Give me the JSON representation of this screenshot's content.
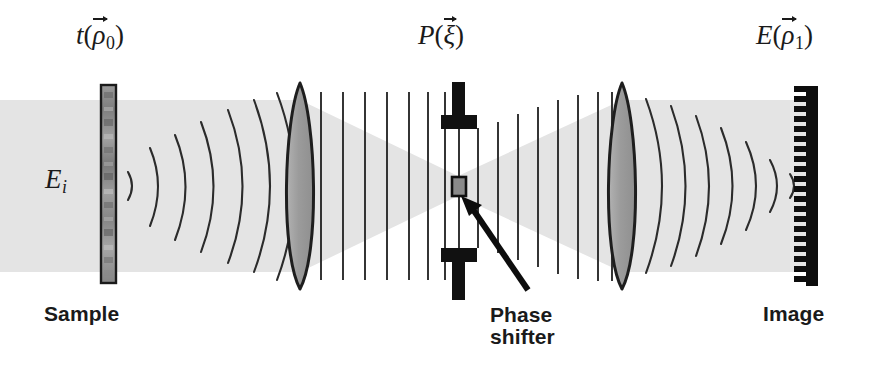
{
  "figure": {
    "title_alt": "Optical phase contrast imaging system schematic",
    "background_color": "#ffffff",
    "width": 869,
    "height": 371
  },
  "colors": {
    "beam_fill": "#e4e4e4",
    "beam_fill_dark": "#dcdcdc",
    "lens_fill": "#9d9d9d",
    "lens_stroke": "#1e1e1e",
    "wave_stroke": "#2a2a2a",
    "sample_fill": "#8e8e8e",
    "sample_stroke": "#1a1a1a",
    "stop_fill": "#111111",
    "shifter_fill": "#8a8a8a",
    "detector_fill": "#0d0d0d",
    "text_color": "#1a1a1a"
  },
  "labels": {
    "sample_field": {
      "symbol": "t",
      "arg": "ρ",
      "subscript": "0",
      "vector": true,
      "text": "t(ρ⃗0)"
    },
    "pupil_plane": {
      "symbol": "P",
      "arg": "ξ",
      "subscript": "",
      "vector": true,
      "text": "P(ξ⃗)"
    },
    "image_field": {
      "symbol": "E",
      "arg": "ρ",
      "subscript": "1",
      "vector": true,
      "text": "E(ρ⃗1)"
    },
    "incident_field": {
      "symbol": "E",
      "subscript": "i",
      "text": "Eᵢ"
    },
    "sample_caption": "Sample",
    "phase_shifter_caption_line1": "Phase",
    "phase_shifter_caption_line2": "shifter",
    "image_caption": "Image"
  },
  "components": [
    {
      "name": "sample",
      "type": "transparency-slab",
      "x": 103,
      "label": "Sample"
    },
    {
      "name": "objective-lens",
      "type": "biconvex-lens",
      "x": 300,
      "label": ""
    },
    {
      "name": "fourier-plane",
      "type": "aperture-stop-with-phase-shifter",
      "x": 458,
      "label": "Phase shifter"
    },
    {
      "name": "collector-lens",
      "type": "biconvex-lens",
      "x": 622,
      "label": ""
    },
    {
      "name": "detector-array",
      "type": "comb-detector",
      "x": 808,
      "label": "Image"
    }
  ],
  "wave_groups": [
    {
      "name": "incident-plane-wave",
      "style": "uniform-band",
      "region": "left-of-sample"
    },
    {
      "name": "diverging-spherical-waves",
      "style": "arcs-convex-right",
      "count": 6,
      "region": "sample-to-objective"
    },
    {
      "name": "collimated-plane-waves-left",
      "style": "straight-vertical-lines",
      "count": 8,
      "region": "objective-to-fourier"
    },
    {
      "name": "collimated-plane-waves-right",
      "style": "straight-vertical-lines",
      "count": 8,
      "region": "fourier-to-collector"
    },
    {
      "name": "converging-spherical-waves",
      "style": "arcs-concave-right",
      "count": 6,
      "region": "collector-to-image"
    }
  ],
  "annotations": [
    {
      "name": "phase-shifter-pointer",
      "type": "arrow",
      "from": "Phase shifter caption",
      "to": "phase shifter element"
    }
  ]
}
